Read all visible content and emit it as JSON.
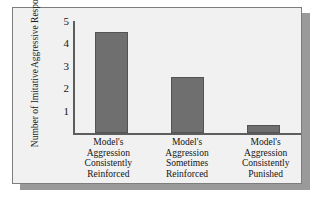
{
  "chart_data": {
    "type": "bar",
    "title": "",
    "xlabel": "",
    "ylabel": "Number of Imitative Aggressive Responses",
    "ylabel_lines": [
      "Number of Imitative",
      "Aggressive Responses"
    ],
    "categories": [
      "Model's Aggression Consistently Reinforced",
      "Model's Aggression Sometimes Reinforced",
      "Model's Aggression Consistently Punished"
    ],
    "category_lines": [
      [
        "Model's",
        "Aggression",
        "Consistently",
        "Reinforced"
      ],
      [
        "Model's",
        "Aggression",
        "Sometimes",
        "Reinforced"
      ],
      [
        "Model's",
        "Aggression",
        "Consistently",
        "Punished"
      ]
    ],
    "values": [
      4.5,
      2.5,
      0.35
    ],
    "ylim": [
      0,
      5
    ],
    "yticks": [
      5,
      4,
      3,
      2,
      1
    ],
    "ytick_labels": [
      "5",
      "4",
      "3",
      "2",
      "1"
    ],
    "grid": false,
    "legend": false,
    "bar_color": "#6f6f6f",
    "bar_edge_color": "#535353",
    "axis_color": "#5d5d5d",
    "panel_background": "#f1f1f1",
    "panel_border_color": "#7d7d7d",
    "shadow_color": "#9a9a9a"
  }
}
